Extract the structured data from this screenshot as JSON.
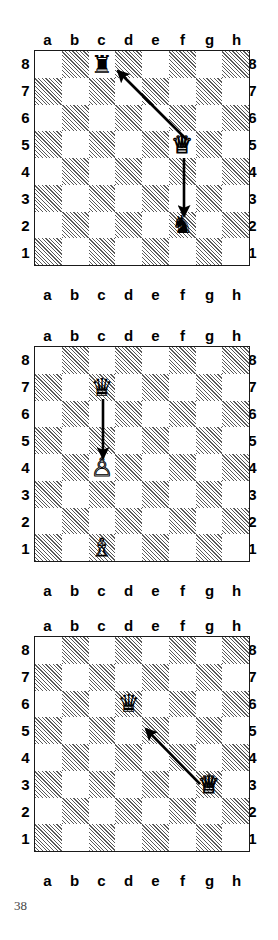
{
  "page": {
    "number": "38",
    "background": "#ffffff",
    "board_border_color": "#1a1a1a",
    "dark_square_color": "#5a5a5a",
    "light_square_color": "#ffffff",
    "arrow_color": "#000000"
  },
  "files": [
    "a",
    "b",
    "c",
    "d",
    "e",
    "f",
    "g",
    "h"
  ],
  "ranks": [
    "8",
    "7",
    "6",
    "5",
    "4",
    "3",
    "2",
    "1"
  ],
  "glyphs": {
    "white_queen": "♕",
    "white_pawn": "♙",
    "white_bishop": "♗",
    "black_queen": "♛",
    "black_rook": "♜",
    "black_knight": "♞"
  },
  "diagrams": [
    {
      "index": "1",
      "top": 30,
      "height": 275,
      "pieces": [
        {
          "square": "c8",
          "file": 2,
          "rank": 0,
          "color": "black",
          "type": "rook",
          "glyph": "♜"
        },
        {
          "square": "f5",
          "file": 5,
          "rank": 3,
          "color": "white",
          "type": "queen",
          "glyph": "♕"
        },
        {
          "square": "f2",
          "file": 5,
          "rank": 6,
          "color": "black",
          "type": "knight",
          "glyph": "♞"
        }
      ],
      "arrows": [
        {
          "from": "f5",
          "to": "c8",
          "x1": 153,
          "y1": 90,
          "x2": 84,
          "y2": 21
        },
        {
          "from": "f5",
          "to": "f2",
          "x1": 150,
          "y1": 108,
          "x2": 150,
          "y2": 166
        }
      ]
    },
    {
      "index": "2",
      "top": 326,
      "height": 275,
      "pieces": [
        {
          "square": "c7",
          "file": 2,
          "rank": 1,
          "color": "black",
          "type": "queen",
          "glyph": "♛"
        },
        {
          "square": "c4",
          "file": 2,
          "rank": 4,
          "color": "white",
          "type": "pawn",
          "glyph": "♙"
        },
        {
          "square": "c1",
          "file": 2,
          "rank": 7,
          "color": "white",
          "type": "bishop",
          "glyph": "♗"
        }
      ],
      "arrows": [
        {
          "from": "c7",
          "to": "c4",
          "x1": 69,
          "y1": 53,
          "x2": 69,
          "y2": 112
        }
      ]
    },
    {
      "index": "3",
      "top": 616,
      "height": 275,
      "pieces": [
        {
          "square": "d6",
          "file": 3,
          "rank": 2,
          "color": "black",
          "type": "queen",
          "glyph": "♛"
        },
        {
          "square": "g3",
          "file": 6,
          "rank": 5,
          "color": "white",
          "type": "queen",
          "glyph": "♕"
        }
      ],
      "arrows": [
        {
          "from": "g3",
          "to": "d6",
          "x1": 166,
          "y1": 148,
          "x2": 112,
          "y2": 93
        }
      ]
    }
  ]
}
